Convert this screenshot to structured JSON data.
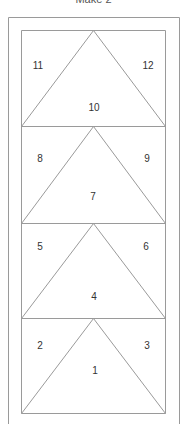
{
  "title": "Make 2",
  "colors": {
    "line": "#9a9a9a",
    "text": "#333333",
    "title": "#555555"
  },
  "diagram": {
    "outer_frame": {
      "x": 8,
      "y": 17,
      "right": 179,
      "bottom": 430
    },
    "inner_frame": {
      "x": 21,
      "y": 30,
      "right": 165,
      "bottom": 413
    },
    "segments": [
      {
        "top": 30,
        "bottom": 126,
        "labels": [
          {
            "text": "11",
            "x": 38,
            "y": 65
          },
          {
            "text": "12",
            "x": 148,
            "y": 65
          },
          {
            "text": "10",
            "x": 94,
            "y": 107
          }
        ]
      },
      {
        "top": 126,
        "bottom": 223,
        "labels": [
          {
            "text": "8",
            "x": 40,
            "y": 158
          },
          {
            "text": "9",
            "x": 147,
            "y": 158
          },
          {
            "text": "7",
            "x": 93,
            "y": 196
          }
        ]
      },
      {
        "top": 223,
        "bottom": 318,
        "labels": [
          {
            "text": "5",
            "x": 40,
            "y": 246
          },
          {
            "text": "6",
            "x": 146,
            "y": 246
          },
          {
            "text": "4",
            "x": 94,
            "y": 296
          }
        ]
      },
      {
        "top": 318,
        "bottom": 413,
        "labels": [
          {
            "text": "2",
            "x": 40,
            "y": 345
          },
          {
            "text": "3",
            "x": 147,
            "y": 345
          },
          {
            "text": "1",
            "x": 95,
            "y": 370
          }
        ]
      }
    ]
  }
}
